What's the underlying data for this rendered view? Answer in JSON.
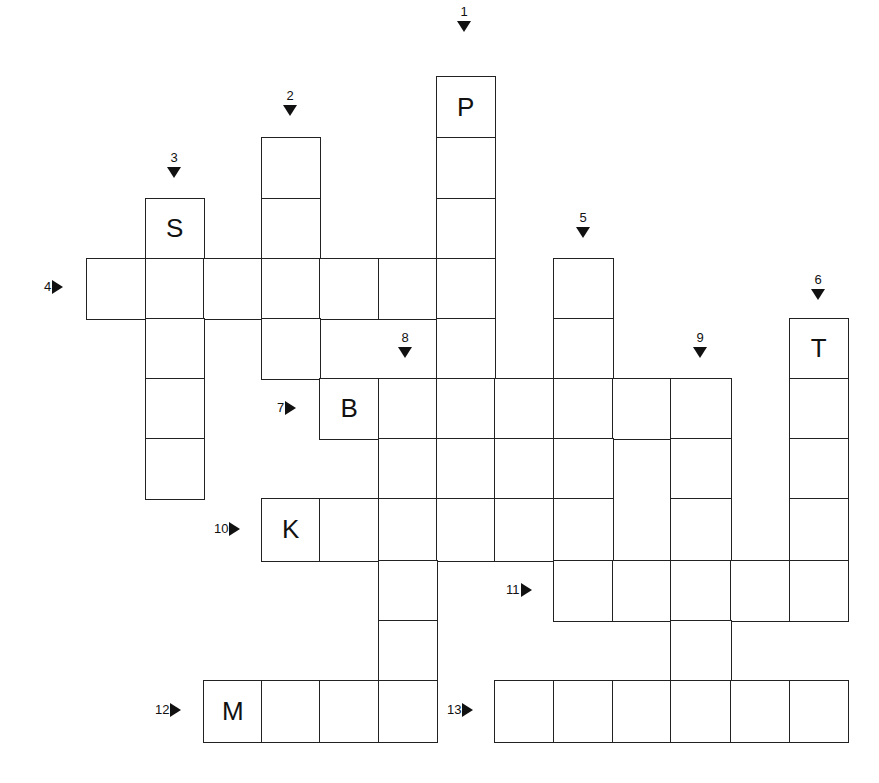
{
  "puzzle": {
    "type": "crossword",
    "grid_origin": {
      "x": 86,
      "y": 76
    },
    "cell_size": {
      "w": 58.5,
      "h": 60.5
    },
    "cells": [
      {
        "r": 0,
        "c": 6,
        "letter": "P"
      },
      {
        "r": 1,
        "c": 3,
        "letter": ""
      },
      {
        "r": 1,
        "c": 6,
        "letter": ""
      },
      {
        "r": 2,
        "c": 1,
        "letter": "S"
      },
      {
        "r": 2,
        "c": 3,
        "letter": ""
      },
      {
        "r": 2,
        "c": 6,
        "letter": ""
      },
      {
        "r": 3,
        "c": 0,
        "letter": ""
      },
      {
        "r": 3,
        "c": 1,
        "letter": ""
      },
      {
        "r": 3,
        "c": 2,
        "letter": ""
      },
      {
        "r": 3,
        "c": 3,
        "letter": ""
      },
      {
        "r": 3,
        "c": 4,
        "letter": ""
      },
      {
        "r": 3,
        "c": 5,
        "letter": ""
      },
      {
        "r": 3,
        "c": 6,
        "letter": ""
      },
      {
        "r": 3,
        "c": 8,
        "letter": ""
      },
      {
        "r": 4,
        "c": 1,
        "letter": ""
      },
      {
        "r": 4,
        "c": 3,
        "letter": ""
      },
      {
        "r": 4,
        "c": 6,
        "letter": ""
      },
      {
        "r": 4,
        "c": 8,
        "letter": ""
      },
      {
        "r": 4,
        "c": 12,
        "letter": "T"
      },
      {
        "r": 5,
        "c": 1,
        "letter": ""
      },
      {
        "r": 5,
        "c": 4,
        "letter": "B"
      },
      {
        "r": 5,
        "c": 5,
        "letter": ""
      },
      {
        "r": 5,
        "c": 6,
        "letter": ""
      },
      {
        "r": 5,
        "c": 7,
        "letter": ""
      },
      {
        "r": 5,
        "c": 8,
        "letter": ""
      },
      {
        "r": 5,
        "c": 9,
        "letter": ""
      },
      {
        "r": 5,
        "c": 10,
        "letter": ""
      },
      {
        "r": 5,
        "c": 12,
        "letter": ""
      },
      {
        "r": 6,
        "c": 1,
        "letter": ""
      },
      {
        "r": 6,
        "c": 5,
        "letter": ""
      },
      {
        "r": 6,
        "c": 6,
        "letter": ""
      },
      {
        "r": 6,
        "c": 7,
        "letter": ""
      },
      {
        "r": 6,
        "c": 8,
        "letter": ""
      },
      {
        "r": 6,
        "c": 10,
        "letter": ""
      },
      {
        "r": 6,
        "c": 12,
        "letter": ""
      },
      {
        "r": 7,
        "c": 3,
        "letter": "K"
      },
      {
        "r": 7,
        "c": 4,
        "letter": ""
      },
      {
        "r": 7,
        "c": 5,
        "letter": ""
      },
      {
        "r": 7,
        "c": 6,
        "letter": ""
      },
      {
        "r": 7,
        "c": 7,
        "letter": ""
      },
      {
        "r": 7,
        "c": 8,
        "letter": ""
      },
      {
        "r": 7,
        "c": 10,
        "letter": ""
      },
      {
        "r": 7,
        "c": 12,
        "letter": ""
      },
      {
        "r": 8,
        "c": 5,
        "letter": ""
      },
      {
        "r": 8,
        "c": 8,
        "letter": ""
      },
      {
        "r": 8,
        "c": 9,
        "letter": ""
      },
      {
        "r": 8,
        "c": 10,
        "letter": ""
      },
      {
        "r": 8,
        "c": 11,
        "letter": ""
      },
      {
        "r": 8,
        "c": 12,
        "letter": ""
      },
      {
        "r": 9,
        "c": 5,
        "letter": ""
      },
      {
        "r": 9,
        "c": 10,
        "letter": ""
      },
      {
        "r": 10,
        "c": 2,
        "letter": "M"
      },
      {
        "r": 10,
        "c": 3,
        "letter": ""
      },
      {
        "r": 10,
        "c": 4,
        "letter": ""
      },
      {
        "r": 10,
        "c": 5,
        "letter": ""
      },
      {
        "r": 10,
        "c": 7,
        "letter": ""
      },
      {
        "r": 10,
        "c": 8,
        "letter": ""
      },
      {
        "r": 10,
        "c": 9,
        "letter": ""
      },
      {
        "r": 10,
        "c": 10,
        "letter": ""
      },
      {
        "r": 10,
        "c": 11,
        "letter": ""
      },
      {
        "r": 10,
        "c": 12,
        "letter": ""
      }
    ],
    "clues": [
      {
        "num": "1",
        "dir": "down",
        "x": 464,
        "y": 4
      },
      {
        "num": "2",
        "dir": "down",
        "x": 290,
        "y": 88
      },
      {
        "num": "3",
        "dir": "down",
        "x": 174,
        "y": 150
      },
      {
        "num": "4",
        "dir": "across",
        "x": 44,
        "y": 279
      },
      {
        "num": "5",
        "dir": "down",
        "x": 583,
        "y": 210
      },
      {
        "num": "6",
        "dir": "down",
        "x": 818,
        "y": 272
      },
      {
        "num": "7",
        "dir": "across",
        "x": 277,
        "y": 400
      },
      {
        "num": "8",
        "dir": "down",
        "x": 405,
        "y": 330
      },
      {
        "num": "9",
        "dir": "down",
        "x": 700,
        "y": 330
      },
      {
        "num": "10",
        "dir": "across",
        "x": 214,
        "y": 521
      },
      {
        "num": "11",
        "dir": "across",
        "x": 506,
        "y": 582
      },
      {
        "num": "12",
        "dir": "across",
        "x": 155,
        "y": 702
      },
      {
        "num": "13",
        "dir": "across",
        "x": 447,
        "y": 702
      }
    ]
  }
}
